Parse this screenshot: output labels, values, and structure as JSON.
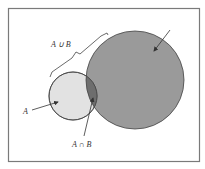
{
  "diagram": {
    "type": "venn",
    "frame": {
      "x": 8,
      "y": 8,
      "width": 192,
      "height": 154,
      "stroke": "#7a7a7a"
    },
    "sets": [
      {
        "id": "A",
        "cx": 73,
        "cy": 96,
        "r": 24,
        "fill": "#e2e2e2"
      },
      {
        "id": "B",
        "cx": 135,
        "cy": 80,
        "r": 49,
        "fill": "#9a9a9a"
      }
    ],
    "intersection_fill": "#6e6e6e",
    "labels": {
      "union": "A ∪ B",
      "set_a": "A",
      "intersection": "A ∩ B"
    }
  }
}
